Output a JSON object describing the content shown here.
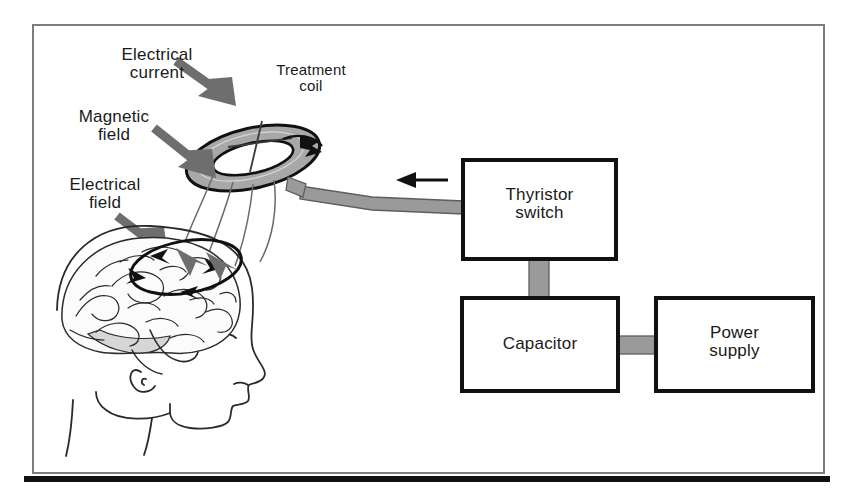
{
  "figure": {
    "title_alt": "Transcranial magnetic stimulation apparatus diagram",
    "frame": {
      "border_color": "#7d7d7d",
      "background": "#ffffff"
    },
    "bottom_rule_color": "#111111"
  },
  "labels": [
    {
      "id": "electrical-current",
      "text": "Electrical\ncurrent",
      "x": 92,
      "y": 46,
      "w": 130,
      "size": 17
    },
    {
      "id": "treatment-coil",
      "text": "Treatment\ncoil",
      "x": 252,
      "y": 62,
      "w": 118,
      "size": 15
    },
    {
      "id": "magnetic-field",
      "text": "Magnetic\nfield",
      "x": 53,
      "y": 108,
      "w": 122,
      "size": 17
    },
    {
      "id": "electrical-field",
      "text": "Electrical\nfield",
      "x": 45,
      "y": 176,
      "w": 120,
      "size": 17
    }
  ],
  "boxes": [
    {
      "id": "thyristor-switch",
      "text": "Thyristor\nswitch",
      "x": 463,
      "y": 160,
      "w": 153,
      "h": 99,
      "size": 17
    },
    {
      "id": "capacitor",
      "text": "Capacitor",
      "x": 462,
      "y": 298,
      "w": 156,
      "h": 93,
      "size": 17
    },
    {
      "id": "power-supply",
      "text": "Power\nsupply",
      "x": 656,
      "y": 298,
      "w": 157,
      "h": 93,
      "size": 17
    }
  ],
  "colors": {
    "cable_gray": "#9a9a9a",
    "cable_stroke": "#5e5e5e",
    "arrow_gray": "#6e6e6e",
    "ink": "#111111",
    "brain_line": "#2b2b2b",
    "coil_fill": "#a8a8a8"
  },
  "connectors": [
    {
      "id": "coil-to-thyristor-cable",
      "from": "treatment-coil",
      "to": "thyristor-switch"
    },
    {
      "id": "thyristor-to-capacitor-cable",
      "from": "thyristor-switch",
      "to": "capacitor"
    },
    {
      "id": "capacitor-to-power-supply-cable",
      "from": "capacitor",
      "to": "power-supply"
    }
  ],
  "arrows": {
    "current_flow_direction": "left",
    "field_arrow_count": 3,
    "induced_loop_arrowheads": 4
  }
}
